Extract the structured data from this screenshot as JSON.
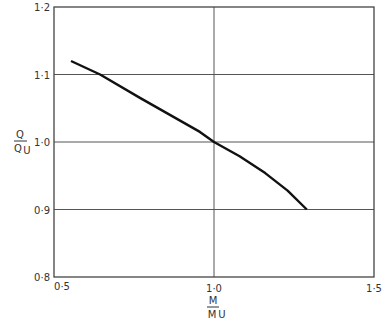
{
  "chart_data": {
    "type": "line",
    "title": "",
    "xlabel": "M / M_U",
    "ylabel": "Q / Q_U",
    "xlim": [
      0.5,
      1.5
    ],
    "ylim": [
      0.8,
      1.2
    ],
    "grid": true,
    "legend": null,
    "x_ticks": [
      0.5,
      1.0,
      1.5
    ],
    "x_tick_labels": [
      "0·5",
      "1·0",
      "1·5"
    ],
    "y_ticks": [
      0.8,
      0.9,
      1.0,
      1.1,
      1.2
    ],
    "y_tick_labels": [
      "0·8",
      "0·9",
      "1·0",
      "1·1",
      "1·2"
    ],
    "series": [
      {
        "name": "Q/Qu vs M/Mu",
        "color": "#111111",
        "x": [
          0.553,
          0.644,
          0.77,
          0.956,
          1.0,
          1.08,
          1.16,
          1.23,
          1.29
        ],
        "y": [
          1.12,
          1.1,
          1.065,
          1.015,
          1.0,
          0.979,
          0.954,
          0.928,
          0.9
        ]
      }
    ]
  },
  "axis_labels": {
    "y_num": "Q",
    "y_den": "Q",
    "y_den_sub": "U",
    "x_num": "M",
    "x_den": "M",
    "x_den_sub": "U"
  }
}
